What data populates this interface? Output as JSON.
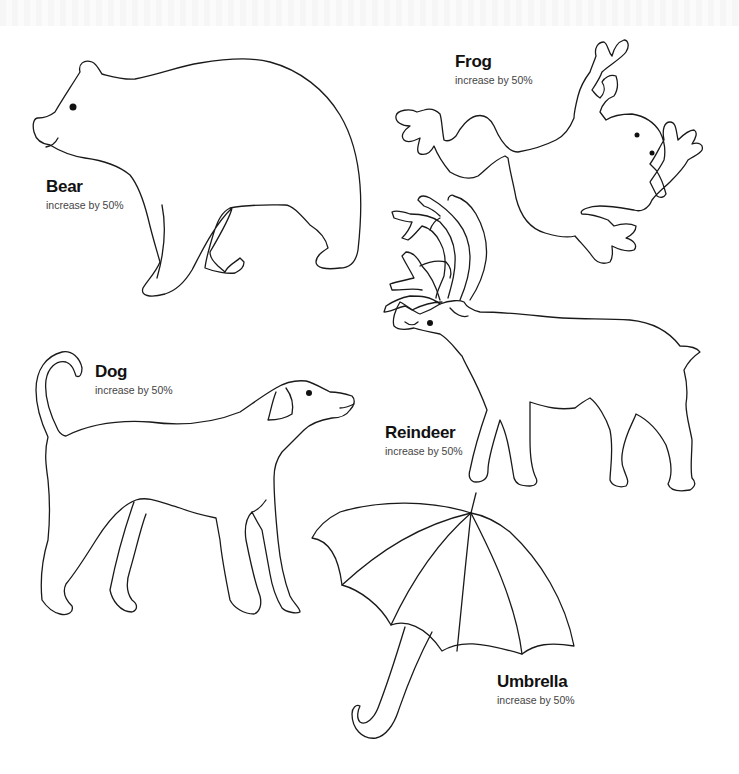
{
  "page": {
    "background": "#ffffff",
    "line_color": "#1a1a1a"
  },
  "templates": [
    {
      "id": "bear",
      "name": "Bear",
      "note": "increase by 50%"
    },
    {
      "id": "frog",
      "name": "Frog",
      "note": "increase by 50%"
    },
    {
      "id": "dog",
      "name": "Dog",
      "note": "increase by 50%"
    },
    {
      "id": "reindeer",
      "name": "Reindeer",
      "note": "increase by 50%"
    },
    {
      "id": "umbrella",
      "name": "Umbrella",
      "note": "increase by 50%"
    }
  ]
}
